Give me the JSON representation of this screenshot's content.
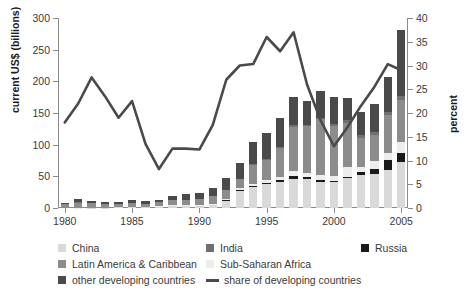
{
  "chart_data": {
    "type": "bar",
    "subtype": "stacked-bar-with-line-overlay",
    "title": "",
    "xlabel": "",
    "ylabel": "current US$ (billions)",
    "ylabel_right": "percent",
    "ylim": [
      0,
      300
    ],
    "ylim_right": [
      0,
      40
    ],
    "yticks": [
      0,
      50,
      100,
      150,
      200,
      250,
      300
    ],
    "yticks_right": [
      0,
      5,
      10,
      15,
      20,
      25,
      30,
      35,
      40
    ],
    "grid": false,
    "legend_position": "below",
    "x": [
      1980,
      1981,
      1982,
      1983,
      1984,
      1985,
      1986,
      1987,
      1988,
      1989,
      1990,
      1991,
      1992,
      1993,
      1994,
      1995,
      1996,
      1997,
      1998,
      1999,
      2000,
      2001,
      2002,
      2003,
      2004,
      2005
    ],
    "xtick_labels": [
      "1980",
      "1985",
      "1990",
      "1995",
      "2000",
      "2005"
    ],
    "xticks": [
      1980,
      1985,
      1990,
      1995,
      2000,
      2005
    ],
    "series": [
      {
        "name": "China",
        "color": "#d9d9d9",
        "values": [
          0,
          0,
          0.5,
          0.6,
          1.3,
          1.7,
          1.9,
          2.3,
          3.2,
          3.4,
          3.5,
          4.4,
          11.2,
          27.5,
          33.8,
          37.5,
          41.7,
          45.3,
          45.5,
          40.3,
          40.7,
          46.9,
          52.7,
          53.5,
          60.6,
          72.4
        ]
      },
      {
        "name": "Russia",
        "color": "#1a1a1a",
        "values": [
          0,
          0,
          0,
          0,
          0,
          0,
          0,
          0,
          0,
          0,
          0,
          0,
          1.2,
          1.7,
          1.0,
          2.1,
          2.6,
          4.9,
          2.8,
          3.3,
          2.7,
          2.5,
          3.5,
          8.0,
          15.4,
          14.6
        ]
      },
      {
        "name": "Sub-Saharan Africa",
        "color": "#ededed",
        "values": [
          0.1,
          0.2,
          0.2,
          0.2,
          0.2,
          0.3,
          0.4,
          0.6,
          0.9,
          1.5,
          1.2,
          1.9,
          1.8,
          2.3,
          3.8,
          4.1,
          4.9,
          8.0,
          6.7,
          8.6,
          6.6,
          14.7,
          9.3,
          12.8,
          11.3,
          17.9
        ]
      },
      {
        "name": "Latin America & Caribbean",
        "color": "#8c8c8c",
        "values": [
          6.1,
          8.5,
          6.7,
          5.0,
          4.2,
          6.2,
          4.5,
          6.0,
          8.8,
          8.1,
          8.8,
          12.5,
          14.4,
          14.5,
          29.2,
          32.3,
          45.5,
          69.1,
          74.0,
          88.0,
          79.0,
          70.0,
          45.0,
          41.0,
          59.0,
          65.0
        ]
      },
      {
        "name": "India",
        "color": "#707070",
        "values": [
          0.1,
          0.1,
          0.1,
          0.1,
          0.1,
          0.1,
          0.1,
          0.2,
          0.1,
          0.3,
          0.2,
          0.1,
          0.3,
          0.6,
          1.0,
          2.1,
          2.4,
          3.6,
          2.6,
          2.2,
          3.6,
          5.5,
          5.6,
          4.6,
          5.8,
          6.7
        ]
      },
      {
        "name": "other developing countries",
        "color": "#4a4a4a",
        "values": [
          2.0,
          5.0,
          4.0,
          4.0,
          3.5,
          4.0,
          3.5,
          3.0,
          6.0,
          9.0,
          10.5,
          12.0,
          18.0,
          25.0,
          35.0,
          41.0,
          45.0,
          44.0,
          37.0,
          42.0,
          43.0,
          34.0,
          35.0,
          44.0,
          55.0,
          104.0
        ]
      }
    ],
    "line_series": {
      "name": "share of developing countries",
      "color": "#4a4a4a",
      "axis": "right",
      "unit": "percent",
      "values": [
        18.0,
        22.0,
        27.5,
        23.5,
        19.0,
        22.5,
        13.5,
        8.2,
        12.5,
        12.5,
        12.3,
        17.5,
        27.0,
        30.0,
        30.3,
        36.0,
        33.0,
        37.0,
        26.0,
        18.5,
        13.0,
        17.0,
        21.5,
        25.5,
        30.3,
        29.0
      ]
    },
    "bar_totals": [
      8.3,
      13.8,
      11.5,
      9.9,
      9.3,
      12.3,
      10.4,
      12.1,
      19.0,
      22.3,
      24.2,
      30.9,
      46.9,
      71.6,
      103.8,
      119.1,
      142.1,
      174.9,
      168.6,
      184.4,
      175.6,
      173.6,
      151.1,
      163.9,
      207.1,
      280.6
    ]
  },
  "axes": {
    "left_title": "current US$ (billions)",
    "right_title": "percent",
    "left_ticks": [
      "300",
      "250",
      "200",
      "150",
      "100",
      "50",
      "0"
    ],
    "right_ticks": [
      "40",
      "35",
      "30",
      "25",
      "20",
      "15",
      "10",
      "5",
      "0"
    ],
    "x_ticks": [
      "1980",
      "1985",
      "1990",
      "1995",
      "2000",
      "2005"
    ]
  },
  "legend": {
    "items": [
      {
        "label": "China",
        "color": "#d9d9d9",
        "type": "swatch"
      },
      {
        "label": "India",
        "color": "#707070",
        "type": "swatch"
      },
      {
        "label": "Russia",
        "color": "#1a1a1a",
        "type": "swatch"
      },
      {
        "label": "Latin America & Caribbean",
        "color": "#8c8c8c",
        "type": "swatch"
      },
      {
        "label": "Sub-Saharan Africa",
        "color": "#ededed",
        "type": "swatch"
      },
      {
        "label": "other developing countries",
        "color": "#4a4a4a",
        "type": "swatch"
      },
      {
        "label": "share of developing countries",
        "color": "#4a4a4a",
        "type": "line"
      }
    ]
  }
}
